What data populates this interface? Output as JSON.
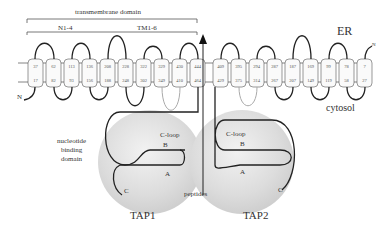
{
  "labels": {
    "transmembrane_domain": "transmembrane domain",
    "n_domain": "N1-4",
    "tm_domain": "TM1-6",
    "er": "ER",
    "cytosol": "cytosol",
    "nbd": "nucleotide binding domain",
    "nbd_line1": "nucleotide",
    "nbd_line2": "binding",
    "nbd_line3": "domain",
    "peptides": "peptides",
    "tap1": "TAP1",
    "tap2": "TAP2",
    "n_left": "N",
    "n_right": "N",
    "c_left": "C",
    "c_right": "C",
    "cloop_left": "C-loop",
    "cloop_right": "C-loop",
    "b_left": "B",
    "b_right": "B",
    "a_left": "A",
    "a_right": "A"
  },
  "tap1_segments": {
    "top": [
      "37",
      "62",
      "113",
      "136",
      "208",
      "228",
      "322",
      "329",
      "430",
      "444"
    ],
    "bottom": [
      "17",
      "82",
      "93",
      "156",
      "188",
      "248",
      "302",
      "349",
      "410",
      "464"
    ]
  },
  "tap2_segments": {
    "top": [
      "409",
      "395",
      "294",
      "287",
      "187",
      "169",
      "99",
      "78",
      "7"
    ],
    "bottom": [
      "429",
      "375",
      "314",
      "267",
      "207",
      "149",
      "119",
      "58",
      "27"
    ]
  },
  "colors": {
    "membrane_line": "#555555",
    "loop": "#222222",
    "grey_loop": "#aaaaaa",
    "nbd_sphere": "#d9d9d9"
  }
}
